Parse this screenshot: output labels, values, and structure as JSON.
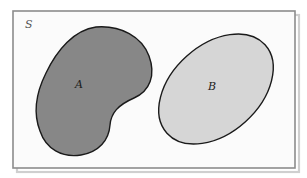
{
  "figure": {
    "kind": "set-diagram",
    "background_color": "#ffffff"
  },
  "universe": {
    "label": "S",
    "border_color": "#8c8c8c",
    "fill_color": "#fbfbfb",
    "shadow_color": "#cfcfcf",
    "rect": {
      "x": 13,
      "y": 11,
      "width": 282,
      "height": 157
    },
    "label_position": {
      "x": 25,
      "y": 28
    }
  },
  "sets": [
    {
      "name": "A",
      "label": "A",
      "shape": "bean",
      "fill_color": "#878787",
      "stroke_color": "#1a1a1a",
      "stroke_width": 1.4,
      "label_position": {
        "x": 79,
        "y": 88
      },
      "path": "M 96 27 C 121 25 142 37 149 56 C 156 75 150 91 134 98 C 118 105 111 113 110 125 C 109 140 99 152 81 155 C 62 158 46 149 40 131 C 33 113 36 93 46 73 C 57 50 74 30 96 27 Z"
    },
    {
      "name": "B",
      "label": "B",
      "shape": "ellipse",
      "fill_color": "#d6d6d6",
      "stroke_color": "#1a1a1a",
      "stroke_width": 1.4,
      "center": {
        "x": 216,
        "y": 89
      },
      "radii": {
        "rx": 66,
        "ry": 44
      },
      "rotation_deg": -42,
      "label_position": {
        "x": 212,
        "y": 90
      }
    }
  ],
  "relations": {
    "intersection": "empty",
    "note": "A and B are disjoint subsets of S"
  },
  "chart_data": {
    "type": "diagram",
    "title": "",
    "elements": [
      {
        "id": "S",
        "role": "universal-set",
        "label": "S",
        "fill": "#fbfbfb"
      },
      {
        "id": "A",
        "role": "set",
        "label": "A",
        "fill": "#878787"
      },
      {
        "id": "B",
        "role": "set",
        "label": "B",
        "fill": "#d6d6d6"
      }
    ],
    "legend": []
  }
}
